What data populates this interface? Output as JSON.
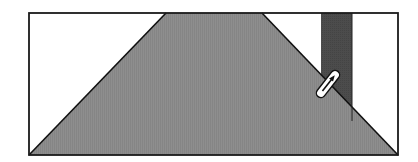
{
  "diagram": {
    "colors": {
      "background": "#ffffff",
      "frame_stroke": "#1a1a1a",
      "trapezoid_fill": "#8c8c8c",
      "bar_fill": "#4a4a4a",
      "stylus_fill": "#ffffff",
      "stylus_stroke": "#111111"
    },
    "elements": [
      {
        "name": "frame",
        "kind": "rectangle"
      },
      {
        "name": "trapezoid",
        "kind": "polygon"
      },
      {
        "name": "vertical-bar",
        "kind": "rectangle"
      },
      {
        "name": "stylus",
        "kind": "icon"
      }
    ]
  }
}
